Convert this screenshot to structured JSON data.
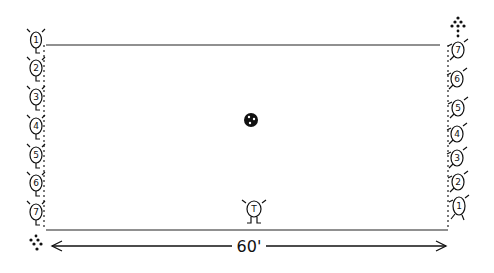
{
  "diagram": {
    "field": {
      "width_label": "60'"
    },
    "left_team": {
      "players": [
        "1",
        "2",
        "3",
        "4",
        "5",
        "6",
        "7"
      ]
    },
    "right_team": {
      "players": [
        "7",
        "6",
        "5",
        "4",
        "3",
        "2",
        "1"
      ]
    },
    "center_marker": {
      "type": "ball"
    },
    "official": {
      "label": "T"
    },
    "colors": {
      "ink": "#111111",
      "background": "#ffffff"
    }
  }
}
